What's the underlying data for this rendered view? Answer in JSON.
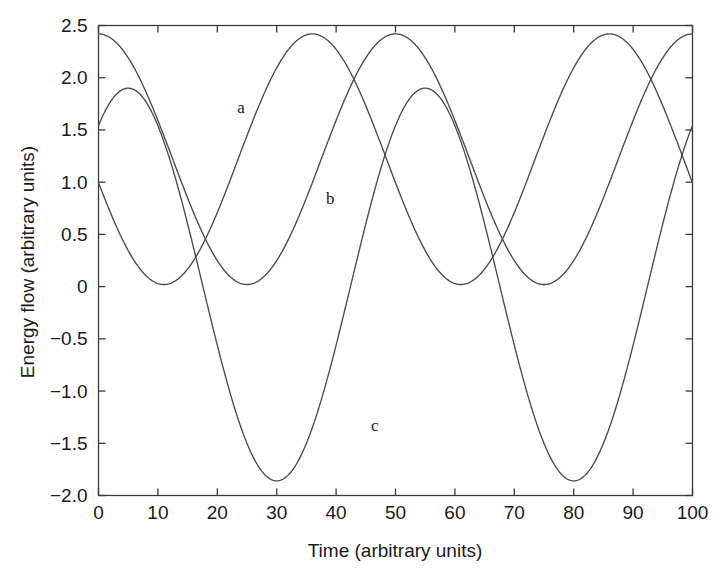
{
  "chart_data": {
    "type": "line",
    "title": "",
    "subtitle": "",
    "xlabel": "Time (arbitrary units)",
    "ylabel": "Energy flow (arbitrary units)",
    "xlim": [
      0,
      100
    ],
    "ylim": [
      -2.0,
      2.5
    ],
    "grid": false,
    "legend_position": "inline-annotations",
    "xticks": [
      0,
      10,
      20,
      30,
      40,
      50,
      60,
      70,
      80,
      90,
      100
    ],
    "xtick_labels": [
      "0",
      "10",
      "20",
      "30",
      "40",
      "50",
      "60",
      "70",
      "80",
      "90",
      "100"
    ],
    "yticks": [
      -2.0,
      -1.5,
      -1.0,
      -0.5,
      0,
      0.5,
      1.0,
      1.5,
      2.0,
      2.5
    ],
    "ytick_labels": [
      "−2.0",
      "−1.5",
      "−1.0",
      "−0.5",
      "0",
      "0.5",
      "1.0",
      "1.5",
      "2.0",
      "2.5"
    ],
    "annotations": [
      {
        "text": "a",
        "x": 24.0,
        "y": 1.66
      },
      {
        "text": "b",
        "x": 39.0,
        "y": 0.79
      },
      {
        "text": "c",
        "x": 46.5,
        "y": -1.38
      }
    ],
    "series": [
      {
        "name": "a",
        "label": "a",
        "model": "cosine",
        "amplitude": 1.2,
        "offset": 1.22,
        "period": 50.0,
        "phase_deg": 0.0,
        "maxima": [
          {
            "x": 0,
            "y": 2.42
          },
          {
            "x": 50,
            "y": 2.42
          },
          {
            "x": 100,
            "y": 2.42
          }
        ],
        "minima": [
          {
            "x": 25,
            "y": 0.02
          },
          {
            "x": 75,
            "y": 0.02
          }
        ],
        "start_value": 2.42,
        "end_value": 2.42
      },
      {
        "name": "b",
        "label": "b",
        "model": "cosine",
        "amplitude": 1.2,
        "offset": 1.22,
        "period": 50.0,
        "phase_deg": 180.0,
        "phase_shift_x": 36.0,
        "maxima": [
          {
            "x": 36,
            "y": 2.42
          },
          {
            "x": 86,
            "y": 2.42
          }
        ],
        "minima": [
          {
            "x": 11,
            "y": 0.02
          },
          {
            "x": 61,
            "y": 0.02
          }
        ],
        "start_value": 0.8,
        "end_value": 1.03
      },
      {
        "name": "c",
        "label": "c",
        "model": "cosine",
        "amplitude": 1.88,
        "offset": 0.02,
        "period": 50.0,
        "phase_shift_x": 5.0,
        "maxima": [
          {
            "x": 5,
            "y": 1.9
          },
          {
            "x": 55,
            "y": 1.9
          }
        ],
        "minima": [
          {
            "x": 30,
            "y": -1.87
          },
          {
            "x": 80,
            "y": -1.87
          }
        ],
        "start_value": 1.62,
        "end_value": 1.46
      }
    ]
  }
}
